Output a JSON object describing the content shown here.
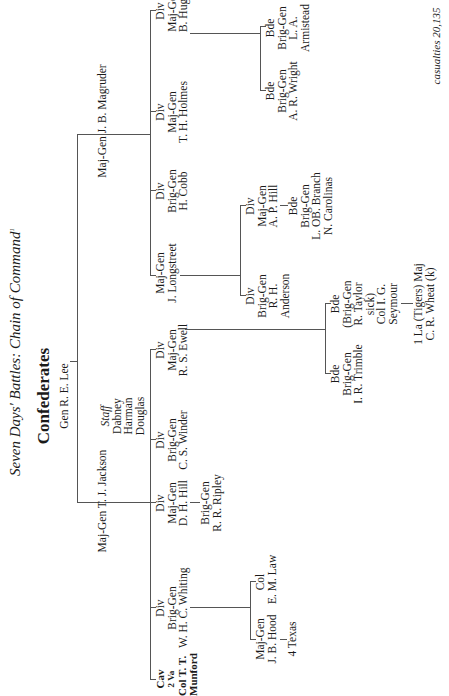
{
  "title": "Seven Days' Battles: Chain of Command",
  "title_footnote": "1",
  "heading": "Confederates",
  "commander": "Gen R. E. Lee",
  "jackson": {
    "label": "Maj-Gen T. J. Jackson",
    "staff": {
      "title": "Staff",
      "members": [
        "Dabney",
        "Harman",
        "Douglas"
      ]
    },
    "units": [
      {
        "lines": [
          "Cav",
          "2 Va",
          "Col T. T.",
          "Munford"
        ]
      },
      {
        "lines": [
          "Div",
          "Brig-Gen",
          "W. H. C. Whiting"
        ],
        "subordinates": [
          {
            "lines": [
              "Maj-Gen",
              "J. B. Hood"
            ],
            "sub": "4 Texas"
          },
          {
            "lines": [
              "Col",
              "E. M. Law"
            ]
          }
        ]
      },
      {
        "lines": [
          "Div",
          "Maj-Gen",
          "D. H. Hill"
        ],
        "subordinates": [
          {
            "lines": [
              "Brig-Gen",
              "R. R. Ripley"
            ]
          }
        ]
      },
      {
        "lines": [
          "Div",
          "Brig-Gen",
          "C. S. Winder"
        ]
      },
      {
        "lines": [
          "Div",
          "Maj-Gen",
          "R. S. Ewell"
        ],
        "subordinates": [
          {
            "lines": [
              "Bde",
              "Brig-Gen",
              "I. R. Trimble"
            ]
          },
          {
            "lines": [
              "Bde",
              "(Brig-Gen",
              "R. Taylor",
              "sick)",
              "Col I. G.",
              "Seymour"
            ],
            "sub_lines": [
              "1 La (Tigers) Maj",
              "C. R. Wheat (k)"
            ]
          }
        ]
      }
    ]
  },
  "magruder": {
    "label": "Maj-Gen J. B. Magruder",
    "units": [
      {
        "lines": [
          "Maj-Gen",
          "J. Longstreet"
        ],
        "subordinates": [
          {
            "lines": [
              "Div",
              "Brig-Gen",
              "R. H.",
              "Anderson"
            ]
          },
          {
            "lines": [
              "Div",
              "Maj-Gen",
              "A. P. Hill"
            ],
            "sub_lines": [
              "Bde",
              "Brig-Gen",
              "L. OB. Branch",
              "N. Carolinas"
            ]
          }
        ]
      },
      {
        "lines": [
          "Div",
          "Brig-Gen",
          "H. Cobb"
        ]
      },
      {
        "lines": [
          "Div",
          "Maj-Gen",
          "T. H. Holmes"
        ]
      },
      {
        "lines": [
          "Div",
          "Maj-Gen",
          "B. Huger"
        ],
        "subordinates": [
          {
            "lines": [
              "Bde",
              "Brig-Gen",
              "A. R. Wright"
            ]
          },
          {
            "lines": [
              "Bde",
              "Brig-Gen",
              "L. A.",
              "Armistead"
            ]
          }
        ]
      }
    ]
  },
  "footer": "casualties 20,135"
}
